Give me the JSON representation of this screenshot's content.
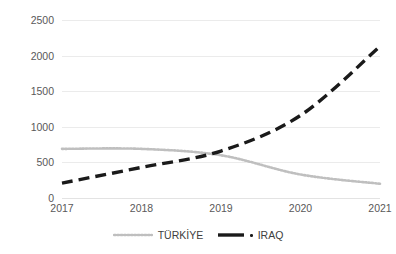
{
  "chart_data": {
    "type": "line",
    "title": "",
    "xlabel": "",
    "ylabel": "",
    "categories": [
      "2017",
      "2018",
      "2019",
      "2020",
      "2021"
    ],
    "x": [
      2017,
      2018,
      2019,
      2020,
      2021
    ],
    "ylim": [
      0,
      2500
    ],
    "xlim": [
      2017,
      2021
    ],
    "yticks": [
      0,
      500,
      1000,
      1500,
      2000,
      2500
    ],
    "ytick_labels": [
      "0",
      "500",
      "1000",
      "1500",
      "2000",
      "2500"
    ],
    "xtick_labels": [
      "2017",
      "2018",
      "2019",
      "2020",
      "2021"
    ],
    "grid": "horizontal",
    "legend_position": "bottom",
    "series": [
      {
        "name": "TÜRKİYE",
        "values": [
          690,
          690,
          600,
          330,
          200
        ],
        "color": "#bfbfbf",
        "style": "dotted"
      },
      {
        "name": "IRAQ",
        "values": [
          210,
          430,
          660,
          1160,
          2130
        ],
        "color": "#1a1a1a",
        "style": "dashed"
      }
    ]
  },
  "axes": {
    "y_ticks": [
      {
        "label": "2500",
        "value": 2500
      },
      {
        "label": "2000",
        "value": 2000
      },
      {
        "label": "1500",
        "value": 1500
      },
      {
        "label": "1000",
        "value": 1000
      },
      {
        "label": "500",
        "value": 500
      },
      {
        "label": "0",
        "value": 0
      }
    ],
    "x_ticks": [
      {
        "label": "2017",
        "value": 2017
      },
      {
        "label": "2018",
        "value": 2018
      },
      {
        "label": "2019",
        "value": 2019
      },
      {
        "label": "2020",
        "value": 2020
      },
      {
        "label": "2021",
        "value": 2021
      }
    ]
  },
  "legend": {
    "items": [
      {
        "label": "TÜRKİYE",
        "color": "#bfbfbf",
        "style": "dotted"
      },
      {
        "label": "IRAQ",
        "color": "#1a1a1a",
        "style": "dashed"
      }
    ]
  },
  "colors": {
    "background": "#ffffff",
    "gridline": "#ebebeb",
    "tick_text": "#595959",
    "legend_text": "#404040",
    "series_turkiye": "#bfbfbf",
    "series_iraq": "#1a1a1a"
  }
}
